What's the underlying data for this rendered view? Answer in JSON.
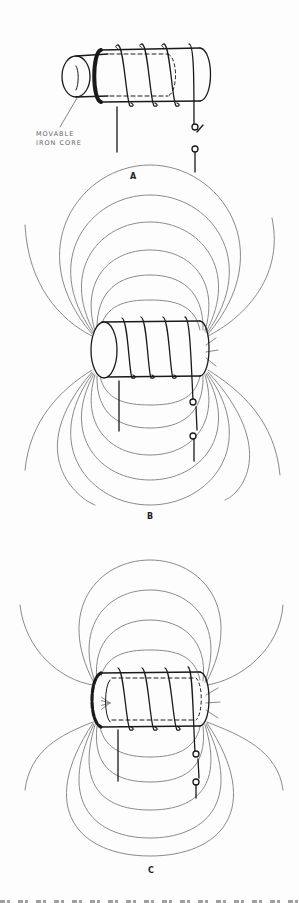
{
  "figure": {
    "panels": [
      {
        "id": "A",
        "label": "A",
        "callout": [
          "MOVABLE",
          "IRON CORE"
        ]
      },
      {
        "id": "B",
        "label": "B"
      },
      {
        "id": "C",
        "label": "C"
      }
    ],
    "colors": {
      "ink": "#1a1a1a",
      "field_line": "#8a8a8a",
      "callout_text": "#666666",
      "background": "#fdfdfd"
    }
  }
}
